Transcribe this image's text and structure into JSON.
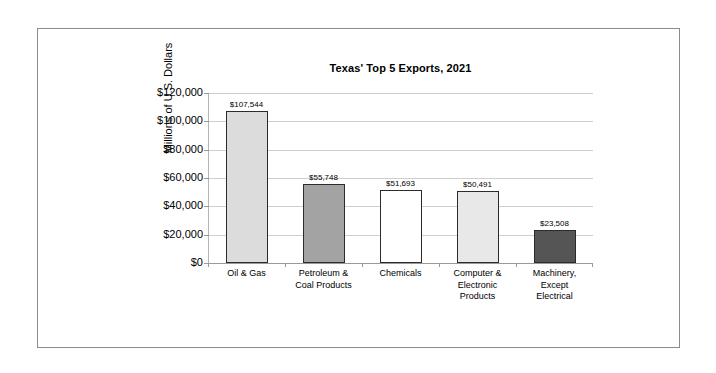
{
  "frame": {
    "border_color": "#8b8b8b"
  },
  "chart_data": {
    "type": "bar",
    "title": "Texas' Top 5 Exports, 2021",
    "xlabel": "",
    "ylabel": "Millions of U.S. Dollars",
    "ylim": [
      0,
      120000
    ],
    "grid": true,
    "legend": "none",
    "categories": [
      "Oil & Gas",
      "Petroleum & Coal Products",
      "Chemicals",
      "Computer & Electronic Products",
      "Machinery, Except Electrical"
    ],
    "category_lines": [
      [
        "Oil & Gas"
      ],
      [
        "Petroleum &",
        "Coal Products"
      ],
      [
        "Chemicals"
      ],
      [
        "Computer &",
        "Electronic",
        "Products"
      ],
      [
        "Machinery,",
        "Except",
        "Electrical"
      ]
    ],
    "values": [
      107544,
      55748,
      51693,
      50491,
      23508
    ],
    "value_labels": [
      "$107,544",
      "$55,748",
      "$51,693",
      "$50,491",
      "$23,508"
    ],
    "bar_colors": [
      "#dcdcdc",
      "#a3a3a3",
      "#ffffff",
      "#e8e8e8",
      "#555555"
    ],
    "bar_border_color": "#2b2b2b",
    "ytick_values": [
      0,
      20000,
      40000,
      60000,
      80000,
      100000,
      120000
    ],
    "ytick_labels": [
      "$0",
      "$20,000",
      "$40,000",
      "$60,000",
      "$80,000",
      "$100,000",
      "$120,000"
    ],
    "gridline_color": "#cfcfcf",
    "axis_color": "#9a9a9a"
  }
}
